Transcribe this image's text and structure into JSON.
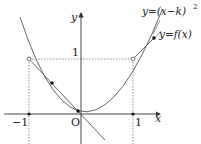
{
  "diagram": {
    "axes": {
      "x_label": "x",
      "y_label": "y",
      "origin_label": "O",
      "tick_neg1": "−1",
      "tick_pos1": "1",
      "y_tick1": "1"
    },
    "curves": {
      "parabola_label": "y=(x−k)",
      "parabola_exponent": "2",
      "f_label": "y=f(x)"
    },
    "colors": {
      "stroke": "#555555",
      "axis": "#333333",
      "text": "#222222",
      "background": "#ffffff"
    }
  }
}
